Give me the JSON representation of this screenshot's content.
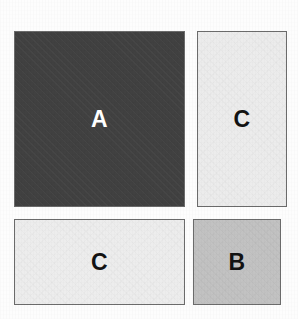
{
  "figure": {
    "canvas": {
      "width": 298,
      "height": 319,
      "background_color": "#fdfdfd"
    },
    "border_color": "#6b6b6b",
    "blocks": [
      {
        "id": "a",
        "label": "A",
        "fill_color": "#414141",
        "text_color": "#ffffff",
        "position": "top-left",
        "shape": "square",
        "x": 14,
        "y": 31,
        "width": 171,
        "height": 176
      },
      {
        "id": "c-top",
        "label": "C",
        "fill_color": "#ececec",
        "text_color": "#121212",
        "position": "top-right",
        "shape": "tall-rectangle",
        "x": 197,
        "y": 31,
        "width": 90,
        "height": 176
      },
      {
        "id": "c-bottom",
        "label": "C",
        "fill_color": "#ededed",
        "text_color": "#121212",
        "position": "bottom-left",
        "shape": "wide-rectangle",
        "x": 14,
        "y": 219,
        "width": 171,
        "height": 86
      },
      {
        "id": "b",
        "label": "B",
        "fill_color": "#c2c2c2",
        "text_color": "#121212",
        "position": "bottom-right",
        "shape": "rectangle",
        "x": 193,
        "y": 219,
        "width": 88,
        "height": 86
      }
    ]
  }
}
